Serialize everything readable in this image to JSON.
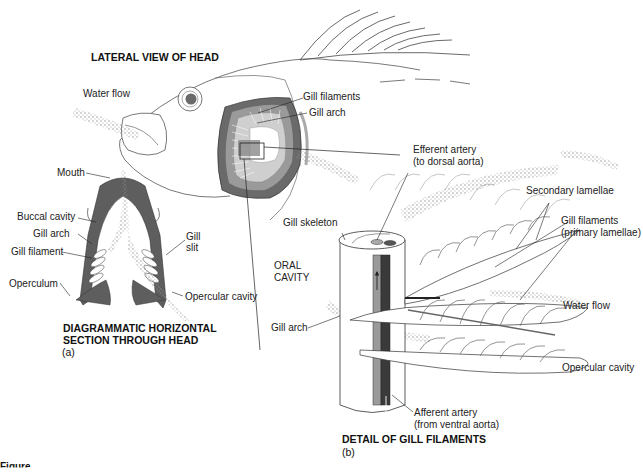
{
  "panel_a": {
    "title": "LATERAL VIEW OF HEAD",
    "labels": {
      "water_flow": "Water flow",
      "gill_filaments": "Gill filaments",
      "gill_arch": "Gill arch"
    }
  },
  "section": {
    "title_line1": "DIAGRAMMATIC HORIZONTAL",
    "title_line2": "SECTION THROUGH HEAD",
    "sub_label": "(a)",
    "labels": {
      "mouth": "Mouth",
      "buccal_cavity": "Buccal cavity",
      "gill_arch": "Gill arch",
      "gill_filament": "Gill filament",
      "operculum": "Operculum",
      "gill_slit_1": "Gill",
      "gill_slit_2": "slit",
      "opercular_cavity": "Opercular cavity"
    }
  },
  "panel_b": {
    "title": "DETAIL OF GILL FILAMENTS",
    "sub_label": "(b)",
    "labels": {
      "efferent_artery_1": "Efferent artery",
      "efferent_artery_2": "(to dorsal aorta)",
      "secondary_lamellae": "Secondary lamellae",
      "gill_filaments_1": "Gill filaments",
      "gill_filaments_2": "(primary lamellae)",
      "gill_skeleton": "Gill skeleton",
      "oral_cavity_1": "ORAL",
      "oral_cavity_2": "CAVITY",
      "water_flow": "Water flow",
      "gill_arch": "Gill arch",
      "opercular_cavity": "Opercular cavity",
      "afferent_artery_1": "Afferent artery",
      "afferent_artery_2": "(from ventral aorta)"
    }
  },
  "caption": "Figure",
  "colors": {
    "dark_tissue": "#5a5a5a",
    "mid_tissue": "#8a8a8a",
    "light_tissue": "#c8c8c8",
    "outline": "#333333",
    "stipple": "#9a9a9a"
  }
}
